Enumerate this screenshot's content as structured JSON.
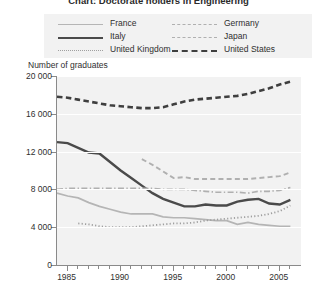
{
  "title": "Chart: Doctorate holders in Engineering",
  "legend": {
    "position": "top",
    "entries": [
      {
        "label": "France",
        "style": "solid-light",
        "color": "#b5b5b5"
      },
      {
        "label": "Italy",
        "style": "solid-dark",
        "color": "#4a4a4a"
      },
      {
        "label": "United Kingdom",
        "style": "dotted-light",
        "color": "#9f9f9f"
      },
      {
        "label": "Germany",
        "style": "dashed-light",
        "color": "#b0b0b0"
      },
      {
        "label": "Japan",
        "style": "dashdot-light",
        "color": "#b0b0b0"
      },
      {
        "label": "United States",
        "style": "dashed-dark",
        "color": "#3f3f3f"
      }
    ]
  },
  "axis": {
    "ylabel": "Number of graduates",
    "yticks": [
      "0",
      "4 000",
      "8 000",
      "12 000",
      "16 000",
      "20 000"
    ],
    "xticks": [
      "1985",
      "1990",
      "1995",
      "2000",
      "2005"
    ]
  },
  "chart_data": {
    "type": "line",
    "title": "Number of graduates",
    "xlabel": "",
    "ylabel": "Number of graduates",
    "xlim": [
      1984,
      2007
    ],
    "ylim": [
      0,
      20000
    ],
    "yticks": [
      0,
      4000,
      8000,
      12000,
      16000,
      20000
    ],
    "xticks": [
      1985,
      1990,
      1995,
      2000,
      2005
    ],
    "grid": "horizontal",
    "legend_position": "top",
    "x": [
      1984,
      1985,
      1986,
      1987,
      1988,
      1989,
      1990,
      1991,
      1992,
      1993,
      1994,
      1995,
      1996,
      1997,
      1998,
      1999,
      2000,
      2001,
      2002,
      2003,
      2004,
      2005,
      2006
    ],
    "series": [
      {
        "name": "United States",
        "style": "dashed-dark",
        "color": "#3f3f3f",
        "values": [
          17800,
          17700,
          17500,
          17300,
          17100,
          16900,
          16800,
          16700,
          16600,
          16600,
          16700,
          17000,
          17300,
          17500,
          17600,
          17700,
          17800,
          17900,
          18100,
          18400,
          18700,
          19100,
          19400
        ]
      },
      {
        "name": "Italy",
        "style": "solid-dark",
        "color": "#4a4a4a",
        "values": [
          13000,
          12900,
          12400,
          11900,
          11800,
          10900,
          10000,
          9200,
          8400,
          7600,
          7000,
          6600,
          6200,
          6200,
          6400,
          6300,
          6300,
          6700,
          6900,
          7000,
          6500,
          6400,
          6900
        ]
      },
      {
        "name": "Germany",
        "style": "dashed-light",
        "color": "#b0b0b0",
        "values": [
          null,
          null,
          null,
          null,
          null,
          null,
          null,
          null,
          11200,
          10600,
          9900,
          9200,
          9300,
          9100,
          9100,
          9100,
          9100,
          9100,
          9100,
          9200,
          9300,
          9400,
          9800
        ]
      },
      {
        "name": "Japan",
        "style": "dashdot-light",
        "color": "#b0b0b0",
        "values": [
          8000,
          8100,
          8100,
          8100,
          8100,
          8100,
          8100,
          8100,
          8100,
          8100,
          8000,
          8000,
          8000,
          7900,
          7800,
          7700,
          7700,
          7700,
          7600,
          7800,
          7800,
          7900,
          8200
        ]
      },
      {
        "name": "France",
        "style": "solid-light",
        "color": "#b5b5b5",
        "values": [
          7600,
          7300,
          7100,
          6600,
          6200,
          5900,
          5600,
          5400,
          5400,
          5400,
          5100,
          5000,
          5000,
          4900,
          4800,
          4700,
          4700,
          4300,
          4500,
          4300,
          4200,
          4100,
          4100
        ]
      },
      {
        "name": "United Kingdom",
        "style": "dotted-light",
        "color": "#9f9f9f",
        "values": [
          null,
          null,
          4400,
          4300,
          4100,
          4000,
          4000,
          4000,
          4100,
          4200,
          4300,
          4400,
          4400,
          4500,
          4700,
          4800,
          4900,
          5000,
          5100,
          5200,
          5400,
          5700,
          6300
        ]
      }
    ]
  }
}
